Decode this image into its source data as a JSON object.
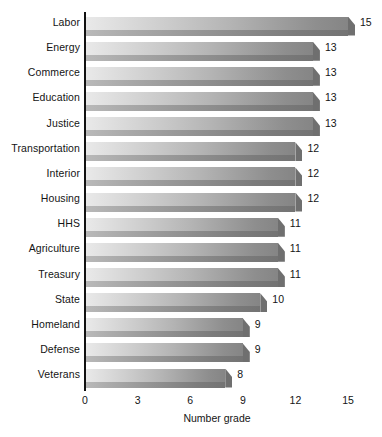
{
  "chart_data": {
    "type": "bar",
    "orientation": "horizontal",
    "title": "",
    "subtitle": "",
    "xlabel": "Number grade",
    "ylabel": "",
    "categories": [
      "Labor",
      "Energy",
      "Commerce",
      "Education",
      "Justice",
      "Transportation",
      "Interior",
      "Housing",
      "HHS",
      "Agriculture",
      "Treasury",
      "State",
      "Homeland",
      "Defense",
      "Veterans"
    ],
    "values": [
      15,
      13,
      13,
      13,
      13,
      12,
      12,
      12,
      11,
      11,
      11,
      10,
      9,
      9,
      8
    ],
    "value_labels": [
      "15",
      "13",
      "13",
      "13",
      "13",
      "12",
      "12",
      "12",
      "11",
      "11",
      "11",
      "10",
      "9",
      "9",
      "8"
    ],
    "xlim": [
      0,
      15
    ],
    "xticks": [
      0,
      3,
      6,
      9,
      12,
      15
    ],
    "xtick_labels": [
      "0",
      "3",
      "6",
      "9",
      "12",
      "15"
    ],
    "grid": false,
    "legend": null,
    "legend_position": "none",
    "bar_style": "3d-gradient-gray",
    "colors": {
      "bar_light": "#e9e9e9",
      "bar_dark": "#858585",
      "bar_shadow": "#7c7c7c",
      "axis": "#111111",
      "text": "#141414",
      "background": "#ffffff"
    }
  }
}
